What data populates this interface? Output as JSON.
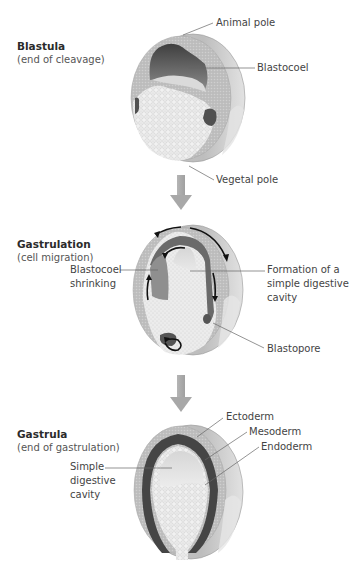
{
  "stages": [
    {
      "title": "Blastula",
      "subtitle": "(end of cleavage)",
      "labels": {
        "animal_pole": "Animal pole",
        "blastocoel": "Blastocoel",
        "vegetal_pole": "Vegetal pole"
      }
    },
    {
      "title": "Gastrulation",
      "subtitle": "(cell migration)",
      "labels": {
        "blastocoel_shrinking_1": "Blastocoel",
        "blastocoel_shrinking_2": "shrinking",
        "formation_1": "Formation of a",
        "formation_2": "simple digestive",
        "formation_3": "cavity",
        "blastopore": "Blastopore"
      }
    },
    {
      "title": "Gastrula",
      "subtitle": "(end of gastrulation)",
      "labels": {
        "ectoderm": "Ectoderm",
        "mesoderm": "Mesoderm",
        "endoderm": "Endoderm",
        "cavity_1": "Simple",
        "cavity_2": "digestive",
        "cavity_3": "cavity"
      }
    }
  ],
  "colors": {
    "outer_layer": "#b9b9b9",
    "shell_side": "#d4d4d4",
    "dark_mesoderm": "#4d4d4d",
    "blastocoel_dark": "#555555",
    "cavity_light": "#e6e6e6",
    "cells": "#efefef",
    "flow_arrow": "#a8a8a8",
    "leader_line": "#6a6a6a"
  }
}
